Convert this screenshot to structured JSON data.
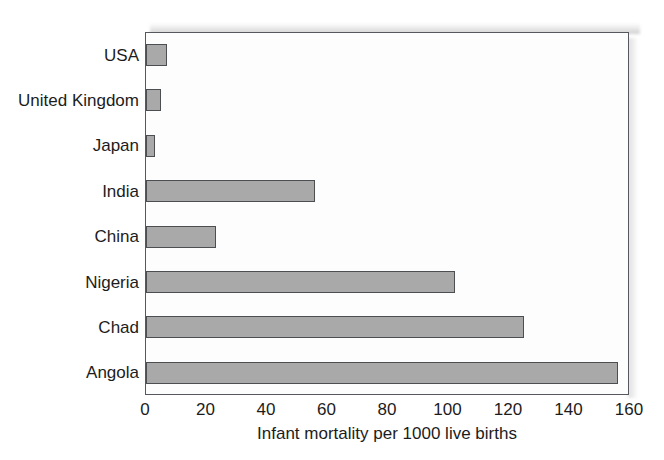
{
  "chart_data": {
    "type": "bar",
    "orientation": "horizontal",
    "title": "",
    "xlabel": "Infant mortality per 1000 live births",
    "ylabel": "",
    "categories": [
      "USA",
      "United Kingdom",
      "Japan",
      "India",
      "China",
      "Nigeria",
      "Chad",
      "Angola"
    ],
    "values": [
      7,
      5,
      3,
      56,
      23,
      102,
      125,
      156
    ],
    "xlim": [
      0,
      160
    ],
    "xticks": [
      0,
      20,
      40,
      60,
      80,
      100,
      120,
      140,
      160
    ],
    "xtick_labels": [
      "0",
      "20",
      "40",
      "60",
      "80",
      "100",
      "120",
      "140",
      "160"
    ],
    "grid": false,
    "legend": null,
    "bar_color": "#a9a9a9",
    "bar_border_color": "#4c4f52",
    "axis_color": "#55585c",
    "background": "#fdfdfd"
  }
}
